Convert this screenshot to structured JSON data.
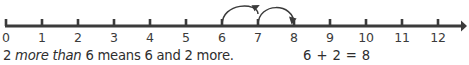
{
  "figure": {
    "type": "number-line-addition-diagram",
    "axis_color": "#3b3b3b",
    "text_color": "#2e2e2e",
    "background": "#ffffff"
  },
  "number_line": {
    "ticks": [
      {
        "label": "0",
        "value": 0,
        "x": 6
      },
      {
        "label": "1",
        "value": 1,
        "x": 42
      },
      {
        "label": "2",
        "value": 2,
        "x": 78
      },
      {
        "label": "3",
        "value": 3,
        "x": 114
      },
      {
        "label": "4",
        "value": 4,
        "x": 150
      },
      {
        "label": "5",
        "value": 5,
        "x": 186
      },
      {
        "label": "6",
        "value": 6,
        "x": 222
      },
      {
        "label": "7",
        "value": 7,
        "x": 258
      },
      {
        "label": "8",
        "value": 8,
        "x": 294
      },
      {
        "label": "9",
        "value": 9,
        "x": 330
      },
      {
        "label": "10",
        "value": 10,
        "x": 366
      },
      {
        "label": "11",
        "value": 11,
        "x": 402
      },
      {
        "label": "12",
        "value": 12,
        "x": 438
      }
    ],
    "min": 0,
    "max": 12,
    "arrow_end": "right"
  },
  "jumps": [
    {
      "name": "jump-one",
      "from": 6,
      "to": 7,
      "from_x": 222,
      "to_x": 258,
      "label": ""
    },
    {
      "name": "jump-two",
      "from": 7,
      "to": 8,
      "from_x": 258,
      "to_x": 294,
      "label": ""
    }
  ],
  "caption": {
    "part1": "2 ",
    "emphasis": "more than",
    "part2": " 6 means 6 and 2 more."
  },
  "equation": {
    "text": "6 + 2 = 8",
    "addend1": "6",
    "operator": "+",
    "addend2": "2",
    "equals": "=",
    "sum": "8"
  }
}
